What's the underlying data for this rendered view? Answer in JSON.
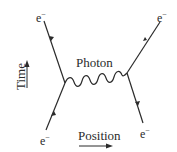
{
  "diagram": {
    "type": "feynman-diagram",
    "labels": {
      "photon": "Photon",
      "time_axis": "Time",
      "position_axis": "Position",
      "electron": "e",
      "electron_charge": "−"
    },
    "particles": [
      {
        "id": "e-in-left",
        "label": "e−",
        "role": "incoming electron"
      },
      {
        "id": "e-out-left",
        "label": "e−",
        "role": "outgoing electron"
      },
      {
        "id": "e-in-right",
        "label": "e−",
        "role": "incoming electron"
      },
      {
        "id": "e-out-right",
        "label": "e−",
        "role": "outgoing electron"
      }
    ],
    "propagator": {
      "label": "Photon",
      "style": "wavy"
    },
    "colors": {
      "line": "#2b2b2b",
      "background": "#ffffff"
    }
  }
}
